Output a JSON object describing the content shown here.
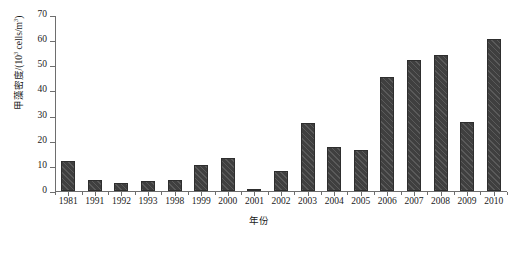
{
  "chart_data": {
    "type": "bar",
    "title": "",
    "xlabel": "年份",
    "ylabel": "甲藻密度/(10³ cells/m³)",
    "ylabel_prefix": "甲藻密度/(10",
    "ylabel_exponent": "3",
    "ylabel_suffix": " cells/m",
    "ylabel_exponent2": "3",
    "ylabel_close": ")",
    "categories": [
      "1981",
      "1991",
      "1992",
      "1993",
      "1998",
      "1999",
      "2000",
      "2001",
      "2002",
      "2003",
      "2004",
      "2005",
      "2006",
      "2007",
      "2008",
      "2009",
      "2010"
    ],
    "values": [
      12,
      4.5,
      3,
      4,
      4.5,
      10.5,
      13,
      1,
      8,
      27,
      17.5,
      16.5,
      45.5,
      52,
      54,
      27.5,
      60.5
    ],
    "ylim": [
      0,
      70
    ],
    "ytick_values": [
      0,
      10,
      20,
      30,
      40,
      50,
      60,
      70
    ],
    "ytick_labels": [
      "0",
      "10",
      "20",
      "30",
      "40",
      "50",
      "60",
      "70"
    ],
    "grid": false,
    "legend": null,
    "series_color": "#3f3f3f",
    "axis_color": "#6e6e6e",
    "bar_hatch": "diagonal-stripe"
  }
}
